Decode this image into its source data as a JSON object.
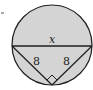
{
  "diagram": {
    "type": "geometry",
    "labels": {
      "diameter": "x",
      "left_leg": "8",
      "right_leg": "8"
    },
    "colors": {
      "fill": "#d4d4d4",
      "stroke": "#1e1e1e",
      "background": "#ffffff"
    },
    "marker": "-"
  }
}
